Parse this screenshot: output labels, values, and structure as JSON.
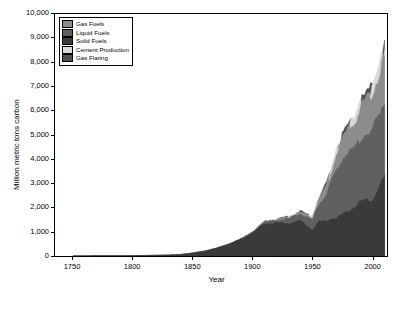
{
  "chart_data": {
    "type": "area",
    "title": "",
    "xlabel": "Year",
    "ylabel": "Million metric tons carbon",
    "xlim": [
      1735,
      2012
    ],
    "ylim": [
      0,
      10000
    ],
    "xticks": [
      1750,
      1800,
      1850,
      1900,
      1950,
      2000
    ],
    "yticks": [
      0,
      1000,
      2000,
      3000,
      4000,
      5000,
      6000,
      7000,
      8000,
      9000,
      10000
    ],
    "ytick_labels": [
      "0",
      "1,000",
      "2,000",
      "3,000",
      "4,000",
      "5,000",
      "6,000",
      "7,000",
      "8,000",
      "9,000",
      "10,000"
    ],
    "grid": false,
    "legend_position": "top-left",
    "stacking": "stacked",
    "legend": [
      {
        "label": "Gas Fuels",
        "color": "#8c8c8c"
      },
      {
        "label": "Liquid Fuels",
        "color": "#606060"
      },
      {
        "label": "Solid Fuels",
        "color": "#3a3a3a"
      },
      {
        "label": "Cement Production",
        "color": "#d9d9d9"
      },
      {
        "label": "Gas Flaring",
        "color": "#4f4f4f"
      }
    ],
    "x": [
      1751,
      1760,
      1770,
      1780,
      1790,
      1800,
      1810,
      1820,
      1830,
      1840,
      1850,
      1860,
      1870,
      1880,
      1890,
      1900,
      1910,
      1920,
      1930,
      1940,
      1950,
      1955,
      1960,
      1965,
      1970,
      1975,
      1980,
      1985,
      1990,
      1995,
      2000,
      2005,
      2008,
      2010
    ],
    "series": [
      {
        "name": "Solid Fuels",
        "color": "#3a3a3a",
        "values": [
          3,
          4,
          6,
          8,
          10,
          14,
          21,
          29,
          43,
          62,
          122,
          200,
          320,
          480,
          680,
          950,
          1340,
          1370,
          1350,
          1460,
          1070,
          1420,
          1410,
          1550,
          1560,
          1710,
          1840,
          2010,
          2250,
          2280,
          2340,
          2780,
          3110,
          3250
        ]
      },
      {
        "name": "Liquid Fuels",
        "color": "#606060",
        "values": [
          0,
          0,
          0,
          0,
          0,
          0,
          0,
          0,
          0,
          0,
          0,
          1,
          2,
          5,
          12,
          24,
          60,
          100,
          190,
          280,
          420,
          680,
          1010,
          1380,
          2000,
          2300,
          2500,
          2350,
          2600,
          2760,
          2840,
          3000,
          3050,
          3100
        ]
      },
      {
        "name": "Gas Fuels",
        "color": "#8c8c8c",
        "values": [
          0,
          0,
          0,
          0,
          0,
          0,
          0,
          0,
          0,
          0,
          0,
          0,
          0,
          0,
          1,
          3,
          12,
          25,
          45,
          70,
          100,
          190,
          300,
          430,
          650,
          790,
          940,
          1090,
          1270,
          1420,
          1520,
          1650,
          1740,
          1800
        ]
      },
      {
        "name": "Cement Production",
        "color": "#d9d9d9",
        "values": [
          0,
          0,
          0,
          0,
          0,
          0,
          0,
          0,
          0,
          0,
          0,
          0,
          0,
          0,
          0,
          1,
          2,
          5,
          10,
          15,
          18,
          30,
          45,
          60,
          80,
          95,
          120,
          140,
          160,
          190,
          220,
          300,
          350,
          380
        ]
      },
      {
        "name": "Gas Flaring",
        "color": "#4f4f4f",
        "values": [
          0,
          0,
          0,
          0,
          0,
          0,
          0,
          0,
          0,
          0,
          0,
          0,
          0,
          0,
          0,
          0,
          1,
          3,
          8,
          14,
          23,
          40,
          60,
          80,
          95,
          100,
          95,
          85,
          80,
          70,
          65,
          60,
          60,
          60
        ]
      }
    ],
    "total_peak": {
      "year": 2010,
      "value": 8590
    }
  }
}
